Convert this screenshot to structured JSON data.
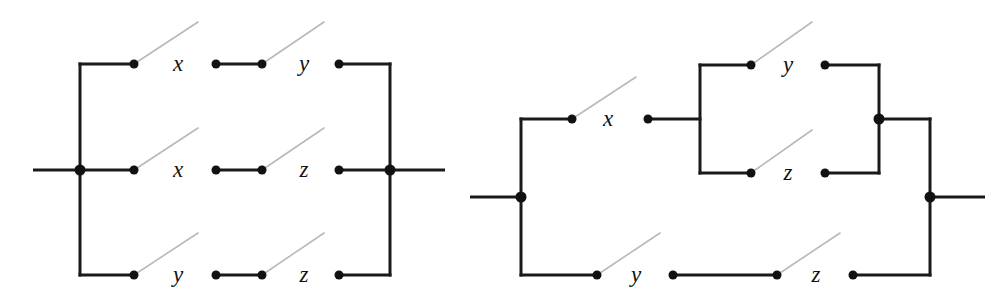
{
  "figure": {
    "name": "switching-circuit-diagrams",
    "background_color": "#ffffff",
    "wire_color": "#1a1a1a",
    "lever_color": "#b9b9b9",
    "terminal_color": "#111111",
    "width": 1006,
    "height": 304
  },
  "diagrams": [
    {
      "id": "left-network",
      "name": "parallel-network-three-branches",
      "terminals": {
        "input_lead": {
          "x1": 33,
          "y1": 170,
          "x2": 80,
          "y2": 170
        },
        "output_lead": {
          "x1": 390,
          "y1": 170,
          "x2": 445,
          "y2": 170
        },
        "left_rail": {
          "x": 80,
          "y_top": 64,
          "y_bottom": 275
        },
        "right_rail": {
          "x": 390,
          "y_top": 64,
          "y_bottom": 275
        },
        "input_junction": {
          "x": 80,
          "y": 170
        },
        "output_junction": {
          "x": 390,
          "y": 170
        }
      },
      "branches": [
        {
          "row": "top",
          "y": 64,
          "switches": [
            {
              "label": "x",
              "label_x": 178,
              "label_y": 71,
              "dot_left_x": 134,
              "dot_right_x": 216,
              "lever_to_x": 198,
              "lever_to_y": 22
            },
            {
              "label": "y",
              "label_x": 304,
              "label_y": 71,
              "dot_left_x": 262,
              "dot_right_x": 339,
              "lever_to_x": 324,
              "lever_to_y": 22
            }
          ],
          "segments": [
            {
              "x1": 80,
              "y1": 64,
              "x2": 134,
              "y2": 64
            },
            {
              "x1": 216,
              "y1": 64,
              "x2": 262,
              "y2": 64
            },
            {
              "x1": 339,
              "y1": 64,
              "x2": 390,
              "y2": 64
            }
          ]
        },
        {
          "row": "middle",
          "y": 170,
          "switches": [
            {
              "label": "x",
              "label_x": 178,
              "label_y": 177,
              "dot_left_x": 134,
              "dot_right_x": 216,
              "lever_to_x": 198,
              "lever_to_y": 128
            },
            {
              "label": "z",
              "label_x": 304,
              "label_y": 177,
              "dot_left_x": 262,
              "dot_right_x": 339,
              "lever_to_x": 324,
              "lever_to_y": 128
            }
          ],
          "segments": [
            {
              "x1": 80,
              "y1": 170,
              "x2": 134,
              "y2": 170
            },
            {
              "x1": 216,
              "y1": 170,
              "x2": 262,
              "y2": 170
            },
            {
              "x1": 339,
              "y1": 170,
              "x2": 390,
              "y2": 170
            }
          ]
        },
        {
          "row": "bottom",
          "y": 275,
          "switches": [
            {
              "label": "y",
              "label_x": 178,
              "label_y": 282,
              "dot_left_x": 134,
              "dot_right_x": 216,
              "lever_to_x": 198,
              "lever_to_y": 233
            },
            {
              "label": "z",
              "label_x": 304,
              "label_y": 282,
              "dot_left_x": 262,
              "dot_right_x": 339,
              "lever_to_x": 324,
              "lever_to_y": 233
            }
          ],
          "segments": [
            {
              "x1": 80,
              "y1": 275,
              "x2": 134,
              "y2": 275
            },
            {
              "x1": 216,
              "y1": 275,
              "x2": 262,
              "y2": 275
            },
            {
              "x1": 339,
              "y1": 275,
              "x2": 390,
              "y2": 275
            }
          ]
        }
      ]
    },
    {
      "id": "right-network",
      "name": "series-parallel-factored-network",
      "terminals": {
        "input_lead": {
          "x1": 470,
          "y1": 197,
          "x2": 521,
          "y2": 197
        },
        "output_lead": {
          "x1": 930,
          "y1": 197,
          "x2": 985,
          "y2": 197
        },
        "left_rail": {
          "x": 521,
          "y_top": 119,
          "y_bottom": 275
        },
        "right_rail": {
          "x": 930,
          "y_top": 119,
          "y_bottom": 275
        },
        "input_junction": {
          "x": 521,
          "y": 197
        },
        "output_junction": {
          "x": 930,
          "y": 197
        },
        "inner_left_rail": {
          "x": 700,
          "y_top": 65,
          "y_bottom": 173
        },
        "inner_right_rail": {
          "x": 879,
          "y_top": 65,
          "y_bottom": 173
        },
        "inner_right_junction": {
          "x": 879,
          "y": 119
        }
      },
      "branches": [
        {
          "row": "top",
          "y": 119,
          "switches": [
            {
              "label": "x",
              "label_x": 608,
              "label_y": 126,
              "dot_left_x": 572,
              "dot_right_x": 648,
              "lever_to_x": 636,
              "lever_to_y": 77
            }
          ],
          "segments": [
            {
              "x1": 521,
              "y1": 119,
              "x2": 572,
              "y2": 119
            },
            {
              "x1": 648,
              "y1": 119,
              "x2": 700,
              "y2": 119
            },
            {
              "x1": 879,
              "y1": 119,
              "x2": 930,
              "y2": 119
            }
          ]
        },
        {
          "row": "inner-top",
          "y": 65,
          "switches": [
            {
              "label": "y",
              "label_x": 788,
              "label_y": 72,
              "dot_left_x": 751,
              "dot_right_x": 825,
              "lever_to_x": 812,
              "lever_to_y": 22
            }
          ],
          "segments": [
            {
              "x1": 700,
              "y1": 65,
              "x2": 751,
              "y2": 65
            },
            {
              "x1": 825,
              "y1": 65,
              "x2": 879,
              "y2": 65
            }
          ]
        },
        {
          "row": "inner-bottom",
          "y": 173,
          "switches": [
            {
              "label": "z",
              "label_x": 788,
              "label_y": 180,
              "dot_left_x": 751,
              "dot_right_x": 825,
              "lever_to_x": 812,
              "lever_to_y": 130
            }
          ],
          "segments": [
            {
              "x1": 700,
              "y1": 173,
              "x2": 751,
              "y2": 173
            },
            {
              "x1": 825,
              "y1": 173,
              "x2": 879,
              "y2": 173
            }
          ]
        },
        {
          "row": "bottom",
          "y": 275,
          "switches": [
            {
              "label": "y",
              "label_x": 636,
              "label_y": 282,
              "dot_left_x": 597,
              "dot_right_x": 673,
              "lever_to_x": 660,
              "lever_to_y": 233
            },
            {
              "label": "z",
              "label_x": 816,
              "label_y": 282,
              "dot_left_x": 777,
              "dot_right_x": 853,
              "lever_to_x": 840,
              "lever_to_y": 233
            }
          ],
          "segments": [
            {
              "x1": 521,
              "y1": 275,
              "x2": 597,
              "y2": 275
            },
            {
              "x1": 673,
              "y1": 275,
              "x2": 777,
              "y2": 275
            },
            {
              "x1": 853,
              "y1": 275,
              "x2": 930,
              "y2": 275
            }
          ]
        }
      ]
    }
  ],
  "labels": {
    "all_switch_names": [
      "x",
      "y",
      "z"
    ]
  }
}
